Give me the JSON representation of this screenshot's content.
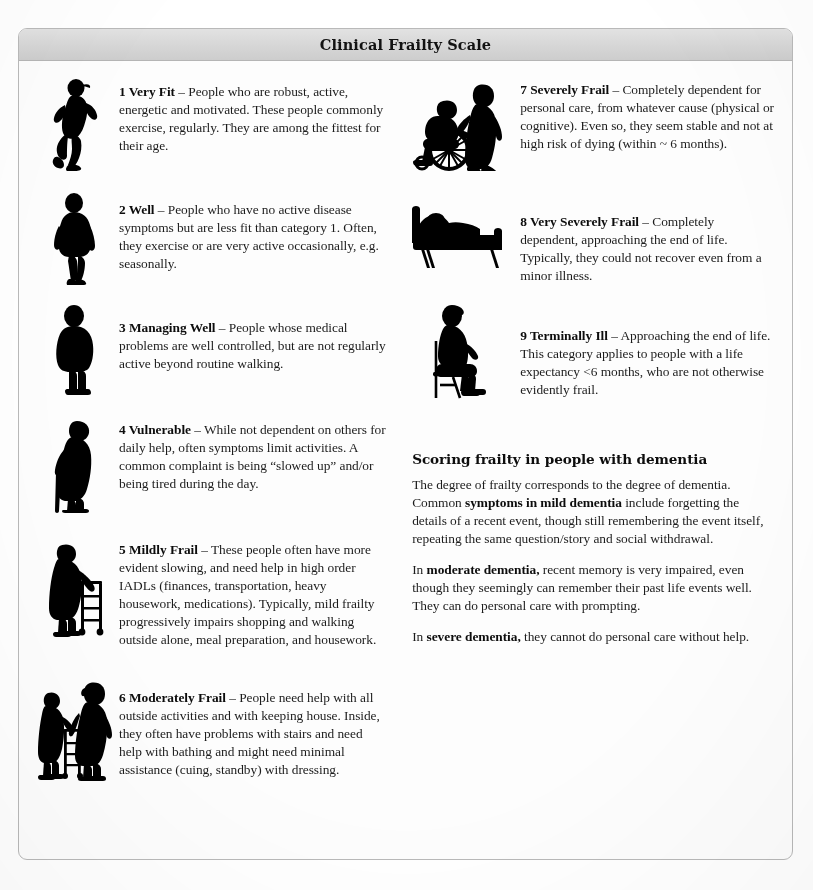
{
  "header": {
    "title": "Clinical Frailty Scale"
  },
  "colors": {
    "header_bar": "#d6d6d6",
    "card_border": "#b9b9b9",
    "figure": "#000000",
    "text": "#1c1c1c",
    "page_background": "#ffffff"
  },
  "scale_items": [
    {
      "number": "1",
      "name": "Very Fit",
      "icon": "running-person-silhouette",
      "lead": "1 Very Fit",
      "dash": " – ",
      "description": "People who are robust, active, energetic and motivated. These people commonly exercise, regularly. They are among the fittest for their age."
    },
    {
      "number": "2",
      "name": "Well",
      "icon": "walking-person-silhouette",
      "lead": "2 Well",
      "dash": " – ",
      "description": "People who have no active disease symptoms but are less fit than category 1. Often, they exercise or are very active occasionally, e.g. seasonally."
    },
    {
      "number": "3",
      "name": "Managing Well",
      "icon": "standing-person-silhouette",
      "lead": "3 Managing Well",
      "dash": " – ",
      "description": "People whose medical problems are well controlled, but are not regularly active beyond routine walking."
    },
    {
      "number": "4",
      "name": "Vulnerable",
      "icon": "person-with-cane-silhouette",
      "lead": "4 Vulnerable",
      "dash": " – ",
      "description": "While not dependent on others for daily help, often symptoms limit activities. A common complaint is being “slowed up” and/or being tired during the day."
    },
    {
      "number": "5",
      "name": "Mildly Frail",
      "icon": "person-with-walker-silhouette",
      "lead": "5 Mildly Frail",
      "dash": " – ",
      "description": "These people often have more evident slowing, and need help in high order IADLs (finances, transportation, heavy housework, medications). Typically, mild frailty progressively impairs shopping and walking outside alone, meal preparation, and housework."
    },
    {
      "number": "6",
      "name": "Moderately Frail",
      "icon": "person-assisted-with-walker-silhouette",
      "lead": "6 Moderately Frail",
      "dash": " – ",
      "description": "People need help with all outside activities and with keeping house. Inside, they often have problems with stairs and need help with bathing and might need minimal assistance (cuing, standby) with dressing."
    },
    {
      "number": "7",
      "name": "Severely Frail",
      "icon": "wheelchair-with-attendant-silhouette",
      "lead": "7 Severely Frail",
      "dash": " – ",
      "description": "Completely dependent for personal care, from whatever cause (physical or cognitive). Even so, they seem stable and not at high risk of dying (within ~ 6 months)."
    },
    {
      "number": "8",
      "name": "Very Severely Frail",
      "icon": "person-in-bed-silhouette",
      "lead": "8 Very Severely Frail",
      "dash": " – ",
      "description": "Completely dependent, approaching the end of life. Typically, they could not recover even from a minor illness."
    },
    {
      "number": "9",
      "name": "Terminally Ill",
      "icon": "seated-person-on-chair-silhouette",
      "lead": "9 Terminally Ill",
      "dash": " – ",
      "description": "Approaching the end of life. This category applies to people with a life expectancy <6 months, who are not otherwise evidently frail."
    }
  ],
  "dementia": {
    "heading": "Scoring frailty in people with dementia",
    "para1_part1": "The degree of frailty corresponds to the degree of dementia. Common ",
    "para1_bold": "symptoms in mild dementia",
    "para1_part2": " include forgetting the details of a recent event, though still remembering the event itself, repeating the same question/story and social withdrawal.",
    "para2_part1": "In ",
    "para2_bold": "moderate dementia,",
    "para2_part2": " recent memory is very impaired, even though they seemingly can remember their past life events well. They can do personal care with prompting.",
    "para3_part1": "In ",
    "para3_bold": "severe dementia,",
    "para3_part2": " they cannot do personal care without help."
  }
}
